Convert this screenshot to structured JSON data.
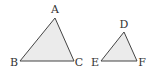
{
  "diagram": {
    "type": "similar-triangles",
    "colors": {
      "fill": "#ebebeb",
      "stroke": "#444444",
      "label": "#333333"
    },
    "triangles": [
      {
        "name": "ABC",
        "vertices": [
          {
            "label": "A",
            "x": 55,
            "y": 18,
            "lx": 55,
            "ly": 13
          },
          {
            "label": "B",
            "x": 20,
            "y": 61,
            "lx": 14,
            "ly": 66
          },
          {
            "label": "C",
            "x": 74,
            "y": 61,
            "lx": 79,
            "ly": 66
          }
        ]
      },
      {
        "name": "DEF",
        "vertices": [
          {
            "label": "D",
            "x": 124,
            "y": 32,
            "lx": 124,
            "ly": 28
          },
          {
            "label": "E",
            "x": 101,
            "y": 61,
            "lx": 95,
            "ly": 66
          },
          {
            "label": "F",
            "x": 137,
            "y": 61,
            "lx": 142,
            "ly": 66
          }
        ]
      }
    ]
  }
}
